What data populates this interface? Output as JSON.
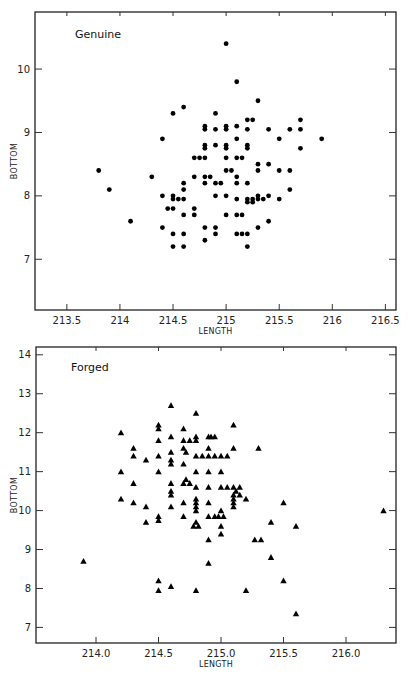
{
  "chart_data": [
    {
      "type": "scatter",
      "title": "Genuine",
      "xlabel": "LENGTH",
      "ylabel": "BOTTOM",
      "marker": "circle",
      "xlim": [
        213.2,
        216.6
      ],
      "ylim": [
        6.2,
        10.9
      ],
      "xticks": [
        213.5,
        214,
        214.5,
        215,
        215.5,
        216,
        216.5
      ],
      "xtick_labels": [
        "213.5",
        "214",
        "214.5",
        "215",
        "215.5",
        "216",
        "216.5"
      ],
      "yticks": [
        7,
        8,
        9,
        10
      ],
      "ytick_labels": [
        "7",
        "8",
        "9",
        "10"
      ],
      "grid": false,
      "points": [
        [
          215.0,
          10.4
        ],
        [
          215.1,
          9.8
        ],
        [
          215.3,
          9.5
        ],
        [
          214.5,
          9.3
        ],
        [
          214.6,
          9.4
        ],
        [
          214.9,
          9.3
        ],
        [
          215.2,
          9.2
        ],
        [
          215.25,
          9.2
        ],
        [
          215.7,
          9.2
        ],
        [
          214.8,
          9.1
        ],
        [
          214.8,
          9.05
        ],
        [
          215.0,
          9.1
        ],
        [
          215.0,
          9.05
        ],
        [
          215.1,
          9.1
        ],
        [
          214.9,
          9.05
        ],
        [
          215.2,
          9.05
        ],
        [
          215.4,
          9.05
        ],
        [
          215.6,
          9.05
        ],
        [
          215.7,
          9.05
        ],
        [
          214.4,
          8.9
        ],
        [
          215.1,
          8.9
        ],
        [
          215.5,
          8.9
        ],
        [
          215.9,
          8.9
        ],
        [
          214.8,
          8.8
        ],
        [
          214.8,
          8.75
        ],
        [
          214.9,
          8.8
        ],
        [
          215.0,
          8.8
        ],
        [
          215.0,
          8.75
        ],
        [
          215.2,
          8.8
        ],
        [
          215.2,
          8.75
        ],
        [
          215.7,
          8.75
        ],
        [
          214.7,
          8.6
        ],
        [
          214.75,
          8.6
        ],
        [
          214.8,
          8.6
        ],
        [
          215.0,
          8.6
        ],
        [
          215.1,
          8.6
        ],
        [
          215.15,
          8.6
        ],
        [
          215.3,
          8.5
        ],
        [
          215.4,
          8.5
        ],
        [
          213.8,
          8.4
        ],
        [
          215.0,
          8.4
        ],
        [
          215.05,
          8.4
        ],
        [
          215.3,
          8.4
        ],
        [
          215.5,
          8.4
        ],
        [
          215.6,
          8.4
        ],
        [
          214.3,
          8.3
        ],
        [
          214.7,
          8.3
        ],
        [
          214.8,
          8.3
        ],
        [
          214.85,
          8.3
        ],
        [
          215.1,
          8.3
        ],
        [
          214.6,
          8.2
        ],
        [
          214.8,
          8.2
        ],
        [
          214.9,
          8.2
        ],
        [
          214.95,
          8.2
        ],
        [
          215.1,
          8.2
        ],
        [
          215.2,
          8.2
        ],
        [
          213.9,
          8.1
        ],
        [
          214.6,
          8.1
        ],
        [
          215.6,
          8.1
        ],
        [
          214.4,
          8.0
        ],
        [
          214.5,
          8.0
        ],
        [
          214.9,
          8.0
        ],
        [
          215.0,
          8.0
        ],
        [
          215.3,
          8.0
        ],
        [
          215.4,
          8.0
        ],
        [
          214.5,
          7.95
        ],
        [
          214.55,
          7.95
        ],
        [
          214.6,
          7.95
        ],
        [
          215.1,
          7.95
        ],
        [
          215.2,
          7.95
        ],
        [
          215.25,
          7.95
        ],
        [
          215.3,
          7.95
        ],
        [
          215.35,
          7.95
        ],
        [
          215.5,
          7.95
        ],
        [
          215.2,
          7.9
        ],
        [
          215.25,
          7.9
        ],
        [
          214.45,
          7.8
        ],
        [
          214.5,
          7.8
        ],
        [
          214.7,
          7.8
        ],
        [
          214.6,
          7.7
        ],
        [
          214.7,
          7.7
        ],
        [
          215.0,
          7.7
        ],
        [
          215.1,
          7.7
        ],
        [
          215.15,
          7.7
        ],
        [
          214.1,
          7.6
        ],
        [
          215.4,
          7.6
        ],
        [
          214.4,
          7.5
        ],
        [
          214.8,
          7.5
        ],
        [
          214.9,
          7.5
        ],
        [
          215.3,
          7.5
        ],
        [
          214.5,
          7.4
        ],
        [
          214.6,
          7.4
        ],
        [
          214.9,
          7.4
        ],
        [
          215.1,
          7.4
        ],
        [
          215.15,
          7.4
        ],
        [
          215.2,
          7.4
        ],
        [
          214.8,
          7.3
        ],
        [
          214.5,
          7.2
        ],
        [
          214.6,
          7.2
        ],
        [
          215.2,
          7.2
        ]
      ]
    },
    {
      "type": "scatter",
      "title": "Forged",
      "xlabel": "LENGTH",
      "ylabel": "BOTTOM",
      "marker": "triangle",
      "xlim": [
        213.52,
        216.4
      ],
      "ylim": [
        6.6,
        14.2
      ],
      "xticks": [
        214.0,
        214.5,
        215.0,
        215.5,
        216.0
      ],
      "xtick_labels": [
        "214.0",
        "214.5",
        "215.0",
        "215.5",
        "216.0"
      ],
      "yticks": [
        7,
        8,
        9,
        10,
        11,
        12,
        13,
        14
      ],
      "ytick_labels": [
        "7",
        "8",
        "9",
        "10",
        "11",
        "12",
        "13",
        "14"
      ],
      "grid": false,
      "points": [
        [
          214.6,
          12.7
        ],
        [
          214.8,
          12.5
        ],
        [
          214.5,
          12.2
        ],
        [
          215.1,
          12.2
        ],
        [
          214.5,
          12.1
        ],
        [
          214.7,
          12.1
        ],
        [
          214.2,
          12.0
        ],
        [
          214.6,
          11.9
        ],
        [
          214.8,
          11.9
        ],
        [
          214.9,
          11.9
        ],
        [
          214.92,
          11.9
        ],
        [
          214.95,
          11.9
        ],
        [
          214.5,
          11.8
        ],
        [
          214.7,
          11.8
        ],
        [
          214.75,
          11.8
        ],
        [
          214.8,
          11.8
        ],
        [
          214.3,
          11.6
        ],
        [
          214.7,
          11.6
        ],
        [
          214.9,
          11.6
        ],
        [
          215.1,
          11.6
        ],
        [
          215.3,
          11.6
        ],
        [
          214.6,
          11.5
        ],
        [
          214.72,
          11.5
        ],
        [
          214.3,
          11.4
        ],
        [
          214.5,
          11.4
        ],
        [
          214.8,
          11.4
        ],
        [
          214.85,
          11.4
        ],
        [
          214.9,
          11.4
        ],
        [
          214.95,
          11.4
        ],
        [
          215.0,
          11.4
        ],
        [
          215.05,
          11.4
        ],
        [
          214.4,
          11.3
        ],
        [
          214.6,
          11.3
        ],
        [
          214.6,
          11.2
        ],
        [
          214.7,
          11.2
        ],
        [
          214.2,
          11.0
        ],
        [
          214.5,
          11.0
        ],
        [
          214.8,
          11.0
        ],
        [
          214.9,
          11.0
        ],
        [
          215.0,
          11.0
        ],
        [
          214.72,
          10.8
        ],
        [
          214.7,
          10.7
        ],
        [
          214.75,
          10.7
        ],
        [
          214.3,
          10.7
        ],
        [
          214.6,
          10.7
        ],
        [
          214.8,
          10.6
        ],
        [
          214.9,
          10.6
        ],
        [
          215.0,
          10.6
        ],
        [
          215.05,
          10.6
        ],
        [
          215.1,
          10.6
        ],
        [
          215.15,
          10.6
        ],
        [
          214.6,
          10.5
        ],
        [
          215.12,
          10.5
        ],
        [
          214.6,
          10.4
        ],
        [
          215.1,
          10.4
        ],
        [
          215.15,
          10.4
        ],
        [
          214.2,
          10.3
        ],
        [
          214.8,
          10.3
        ],
        [
          215.2,
          10.3
        ],
        [
          215.1,
          10.3
        ],
        [
          214.3,
          10.2
        ],
        [
          214.7,
          10.2
        ],
        [
          214.8,
          10.2
        ],
        [
          214.9,
          10.2
        ],
        [
          215.1,
          10.2
        ],
        [
          215.5,
          10.2
        ],
        [
          214.4,
          10.1
        ],
        [
          214.6,
          10.1
        ],
        [
          214.8,
          10.1
        ],
        [
          215.1,
          10.1
        ],
        [
          214.8,
          10.0
        ],
        [
          215.0,
          10.0
        ],
        [
          216.3,
          10.0
        ],
        [
          214.5,
          9.85
        ],
        [
          214.7,
          9.85
        ],
        [
          214.9,
          9.85
        ],
        [
          214.95,
          9.85
        ],
        [
          214.98,
          9.85
        ],
        [
          215.02,
          9.85
        ],
        [
          214.4,
          9.7
        ],
        [
          214.5,
          9.75
        ],
        [
          214.8,
          9.7
        ],
        [
          215.4,
          9.7
        ],
        [
          214.78,
          9.6
        ],
        [
          214.82,
          9.6
        ],
        [
          215.0,
          9.6
        ],
        [
          215.6,
          9.6
        ],
        [
          215.0,
          9.4
        ],
        [
          214.9,
          9.25
        ],
        [
          215.27,
          9.25
        ],
        [
          215.32,
          9.25
        ],
        [
          215.4,
          8.8
        ],
        [
          213.9,
          8.7
        ],
        [
          214.9,
          8.65
        ],
        [
          214.5,
          8.2
        ],
        [
          215.5,
          8.2
        ],
        [
          214.6,
          8.05
        ],
        [
          214.5,
          7.95
        ],
        [
          214.8,
          7.95
        ],
        [
          215.2,
          7.95
        ],
        [
          215.6,
          7.35
        ]
      ]
    }
  ],
  "panels": {
    "genuine": {
      "title": "Genuine",
      "xlabel": "LENGTH",
      "ylabel": "BOTTOM"
    },
    "forged": {
      "title": "Forged",
      "xlabel": "LENGTH",
      "ylabel": "BOTTOM"
    }
  }
}
